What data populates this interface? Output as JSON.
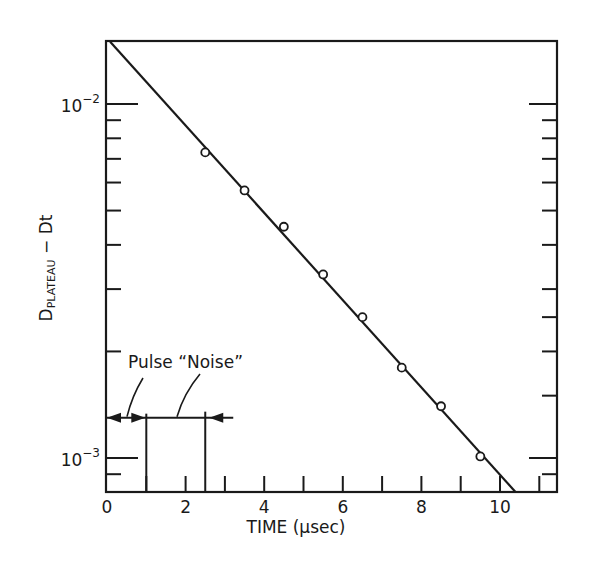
{
  "chart_data": {
    "type": "scatter",
    "title": "",
    "xlabel": "TIME (μsec)",
    "ylabel_main": "D",
    "ylabel_sub": "PLATEAU",
    "ylabel_tail": " − D",
    "ylabel_tail_sub": "t",
    "ylabel": "D_PLATEAU − D_t",
    "yscale": "log",
    "xlim": [
      0,
      11.4
    ],
    "ylim": [
      0.0008,
      0.0152
    ],
    "grid": false,
    "legend": null,
    "x_ticks": [
      0,
      1,
      2,
      3,
      4,
      5,
      6,
      7,
      8,
      9,
      10,
      11
    ],
    "x_tick_labels": [
      {
        "value": 0,
        "label": "0"
      },
      {
        "value": 2,
        "label": "2"
      },
      {
        "value": 4,
        "label": "4"
      },
      {
        "value": 6,
        "label": "6"
      },
      {
        "value": 8,
        "label": "8"
      },
      {
        "value": 10,
        "label": "10"
      }
    ],
    "y_tick_labels": [
      {
        "value": 0.01,
        "base": "10",
        "exp": "−2"
      },
      {
        "value": 0.001,
        "base": "10",
        "exp": "−3"
      }
    ],
    "y_minor_ticks_left": [
      0.009,
      0.008,
      0.007,
      0.006,
      0.005,
      0.004,
      0.003,
      0.002,
      0.0009
    ],
    "y_minor_ticks_right": [
      0.009,
      0.008,
      0.007,
      0.006,
      0.005,
      0.004,
      0.003,
      0.0025,
      0.002,
      0.0015,
      0.0009
    ],
    "series": [
      {
        "name": "measured",
        "marker": "open-circle",
        "x": [
          2.5,
          3.5,
          4.5,
          5.5,
          6.5,
          7.5,
          8.5,
          9.5
        ],
        "values": [
          0.0073,
          0.0057,
          0.0045,
          0.0033,
          0.0025,
          0.0018,
          0.0014,
          0.00101
        ]
      },
      {
        "name": "exponential fit",
        "marker": "line",
        "x": [
          0.08,
          10.4
        ],
        "values": [
          0.015,
          0.0008
        ]
      }
    ],
    "annotations": [
      {
        "text": "Pulse",
        "x": 0.55,
        "y": 0.0013,
        "note": "arrows span 0 to 1 μsec"
      },
      {
        "text": "“Noise”",
        "x": 1.75,
        "y": 0.0013,
        "note": "interval 1 to 2.5 μsec, arrow from right pointing to 2.5"
      }
    ],
    "annotation_label": "Pulse “Noise”",
    "markers": {
      "pulse_start": 0,
      "pulse_end": 1,
      "noise_end": 2.5,
      "bracket_level": 0.0013
    }
  }
}
